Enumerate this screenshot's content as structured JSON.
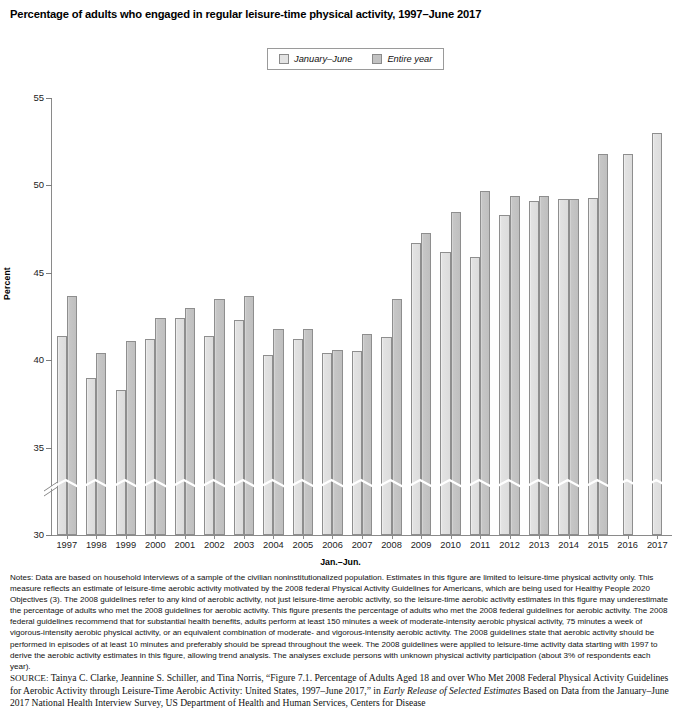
{
  "figure": {
    "title": "Percentage of adults who engaged in regular leisure-time physical activity, 1997–June 2017"
  },
  "legend": {
    "entries": [
      {
        "label": "January–June",
        "swatch": "light-gray-swatch",
        "color": "#e3e3e3"
      },
      {
        "label": "Entire year",
        "swatch": "medium-gray-swatch",
        "color": "#c2c2c2"
      }
    ]
  },
  "chart_data": {
    "type": "bar",
    "title": "Percentage of adults who engaged in regular leisure-time physical activity, 1997–June 2017",
    "xlabel": "Jan.–Jun.",
    "ylabel": "Percent",
    "ylim": [
      30,
      55
    ],
    "yticks": [
      30,
      35,
      40,
      45,
      50,
      55
    ],
    "axis_break": "y-axis broken between 30 and 32.5",
    "grid": false,
    "legend_position": "top-center",
    "categories": [
      "1997",
      "1998",
      "1999",
      "2000",
      "2001",
      "2002",
      "2003",
      "2004",
      "2005",
      "2006",
      "2007",
      "2008",
      "2009",
      "2010",
      "2011",
      "2012",
      "2013",
      "2014",
      "2015",
      "2016",
      "2017"
    ],
    "series": [
      {
        "name": "January–June",
        "values": [
          41.4,
          39.0,
          38.3,
          41.2,
          42.4,
          41.4,
          42.3,
          40.3,
          41.2,
          40.4,
          40.5,
          41.3,
          46.7,
          46.2,
          45.9,
          48.3,
          49.1,
          49.2,
          49.3,
          51.8,
          53.0
        ]
      },
      {
        "name": "Entire year",
        "values": [
          43.7,
          40.4,
          41.1,
          42.4,
          43.0,
          43.5,
          43.7,
          41.8,
          41.8,
          40.6,
          41.5,
          43.5,
          47.3,
          48.5,
          49.7,
          49.4,
          49.4,
          49.2,
          51.8,
          null,
          null
        ]
      }
    ]
  },
  "notes": {
    "text": "Notes: Data are based on household interviews of a sample of the civilian noninstitutionalized population. Estimates in this figure are limited to leisure-time physical activity only. This measure reflects an estimate of leisure-time aerobic activity motivated by the 2008 federal Physical Activity Guidelines for Americans, which are being used for Healthy People 2020 Objectives (3). The 2008 guidelines refer to any kind of aerobic activity, not just leisure-time aerobic activity, so the leisure-time aerobic activity estimates in this figure may underestimate the percentage of adults who met the 2008 guidelines for aerobic activity. This figure presents the percentage of adults who met the 2008 federal guidelines for aerobic activity. The 2008 federal guidelines recommend that for substantial health benefits, adults perform at least 150 minutes a week of moderate-intensity aerobic physical activity, 75 minutes a week of vigorous-intensity aerobic physical activity, or an equivalent combination of moderate- and vigorous-intensity aerobic activity. The 2008 guidelines state that aerobic activity should be performed in episodes of at least 10 minutes and preferably should be spread throughout the week. The 2008 guidelines were applied to leisure-time activity data starting with 1997 to derive the aerobic activity estimates in this figure, allowing trend analysis. The analyses exclude persons with unknown physical activity participation (about 3% of respondents each year)."
  },
  "source": {
    "label": "SOURCE:",
    "part1": " Tainya C. Clarke, Jeannine S. Schiller, and Tina Norris, “Figure 7.1. Percentage of Adults Aged 18 and over Who Met 2008 Federal Physical Activity Guidelines for Aerobic Activity through Leisure-Time Aerobic Activity: United States, 1997–June 2017,” in ",
    "italic1": "Early Release of Selected Estimates",
    "part2": " Based on Data from the January–June 2017 National Health Interview Survey, US Department of Health and Human Services, Centers for Disease"
  }
}
